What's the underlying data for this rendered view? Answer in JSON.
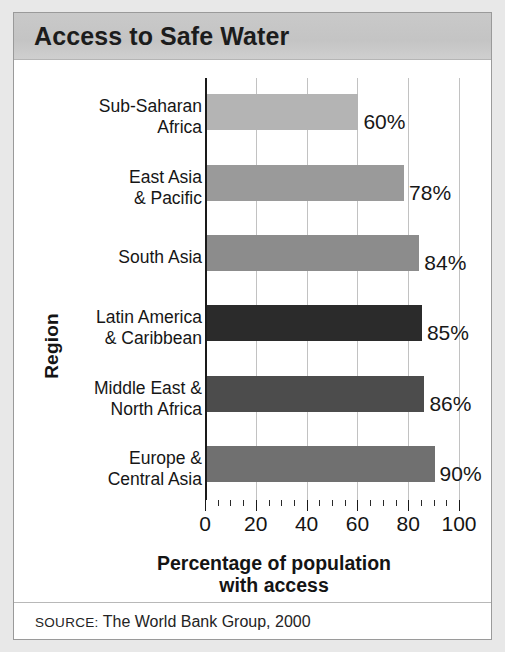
{
  "figure": {
    "title": "Access to Safe Water",
    "source_prefix": "SOURCE:",
    "source_text": " The World Bank Group, 2000"
  },
  "chart_data": {
    "type": "bar",
    "orientation": "horizontal",
    "title": "Access to Safe Water",
    "xlabel": "Percentage of population\nwith access",
    "ylabel": "Region",
    "xlim": [
      0,
      100
    ],
    "xticks": [
      0,
      20,
      40,
      60,
      80,
      100
    ],
    "xtick_labels": [
      "0",
      "20",
      "40",
      "60",
      "80",
      "100"
    ],
    "minor_tick_step": 5,
    "grid": true,
    "legend": "none",
    "categories": [
      "Sub-Saharan\nAfrica",
      "East Asia\n& Pacific",
      "South Asia",
      "Latin America\n& Caribbean",
      "Middle East &\nNorth Africa",
      "Europe &\nCentral Asia"
    ],
    "values": [
      60,
      78,
      84,
      85,
      86,
      90
    ],
    "value_labels": [
      "60%",
      "78%",
      "84%",
      "85%",
      "86%",
      "90%"
    ],
    "bar_colors": [
      "#b4b4b4",
      "#9a9a9a",
      "#8c8c8c",
      "#2b2b2b",
      "#4c4c4c",
      "#707070"
    ]
  },
  "colors": {
    "title_band": "#c7c7c7",
    "axis": "#1a1a1a",
    "gridline": "#c2c2c2",
    "frame": "#9a9a9a",
    "page_background": "#e8e8e8"
  }
}
